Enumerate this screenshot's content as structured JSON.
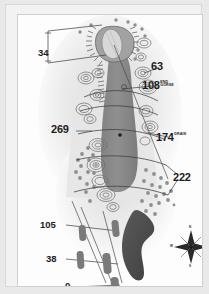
{
  "document": {
    "kind": "golf-hole-yardage-map",
    "title": "Golf Hole Strokesaver Map"
  },
  "colors": {
    "page_background": "#e9e9e9",
    "frame_background": "#f2f2f2",
    "panel_background": "#fdfdfd",
    "fairway": "#8d8d8d",
    "green": "#9a9a9a",
    "rough": "#efefef",
    "semi_rough": "#e3e3e3",
    "hazard": "#4e4e4e",
    "tee": "#7d7d7d",
    "line": "#4a4a4a",
    "text": "#1c1c1c"
  },
  "distance_markers": [
    {
      "id": "m34",
      "value": "34",
      "note": "",
      "x": 31,
      "y": 38,
      "size": "mid"
    },
    {
      "id": "m63",
      "value": "63",
      "note": "",
      "x": 144,
      "y": 56,
      "size": "big"
    },
    {
      "id": "m108",
      "value": "108",
      "note": "END GORSE",
      "note_line1": "END",
      "note_line2": "GORSE",
      "x": 137,
      "y": 75,
      "size": "big"
    },
    {
      "id": "m269",
      "value": "269",
      "note": "",
      "x": 45,
      "y": 118,
      "size": "big"
    },
    {
      "id": "m174",
      "value": "174",
      "note": "DRAIN",
      "note_line1": "DRAIN",
      "note_line2": "",
      "x": 152,
      "y": 125,
      "size": "big"
    },
    {
      "id": "m222",
      "value": "222",
      "note": "",
      "x": 166,
      "y": 165,
      "size": "big"
    },
    {
      "id": "m105",
      "value": "105",
      "note": "",
      "x": 32,
      "y": 213,
      "size": "mid"
    },
    {
      "id": "m38",
      "value": "38",
      "note": "",
      "x": 38,
      "y": 247,
      "size": "mid"
    },
    {
      "id": "m0",
      "value": "0",
      "note": "",
      "x": 55,
      "y": 275,
      "size": "mid"
    }
  ],
  "compass": {
    "name": "compass-rose",
    "x": 178,
    "y": 232,
    "labels": {
      "n": "N",
      "s": "S",
      "e": "E",
      "w": "W"
    }
  },
  "features": {
    "green_label": "green",
    "fairway_label": "fairway",
    "hazard_label": "water hazard",
    "tee_boxes_label": "tee boxes",
    "bunkers_label": "bunkers",
    "gorse_label": "gorse"
  }
}
